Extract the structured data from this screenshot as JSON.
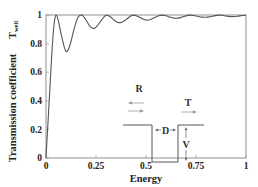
{
  "chart_data": {
    "type": "line",
    "title": "",
    "xlabel": "Energy",
    "ylabel": "Transmission  coefficient",
    "ylabel_extra": "T",
    "ylabel_extra_sub": "well",
    "xlim": [
      0,
      1
    ],
    "ylim": [
      0,
      1
    ],
    "grid": false,
    "legend": null,
    "x_ticks": [
      "0",
      "0.25",
      "0.5",
      "0.75",
      "1"
    ],
    "y_ticks": [
      "0",
      "0.2",
      "0.4",
      "0.6",
      "0.8",
      "1"
    ],
    "series": [
      {
        "name": "T_well",
        "color": "#555555",
        "x": [
          0.0,
          0.01,
          0.02,
          0.03,
          0.04,
          0.05,
          0.06,
          0.08,
          0.1,
          0.12,
          0.14,
          0.16,
          0.18,
          0.2,
          0.22,
          0.24,
          0.26,
          0.28,
          0.3,
          0.32,
          0.34,
          0.36,
          0.38,
          0.4,
          0.42,
          0.44,
          0.46,
          0.48,
          0.5,
          0.52,
          0.54,
          0.56,
          0.58,
          0.6,
          0.62,
          0.64,
          0.66,
          0.68,
          0.7,
          0.72,
          0.74,
          0.76,
          0.78,
          0.8,
          0.82,
          0.84,
          0.86,
          0.88,
          0.9,
          0.92,
          0.94,
          0.96,
          0.98,
          1.0
        ],
        "values": [
          0.0,
          0.25,
          0.5,
          0.75,
          0.93,
          1.0,
          0.97,
          0.84,
          0.745,
          0.79,
          0.9,
          0.985,
          1.0,
          0.965,
          0.92,
          0.905,
          0.93,
          0.97,
          0.998,
          0.99,
          0.965,
          0.948,
          0.95,
          0.968,
          0.99,
          0.999,
          0.99,
          0.975,
          0.965,
          0.967,
          0.98,
          0.993,
          0.999,
          0.995,
          0.985,
          0.978,
          0.978,
          0.985,
          0.994,
          0.999,
          0.997,
          0.99,
          0.985,
          0.984,
          0.988,
          0.994,
          0.999,
          0.998,
          0.993,
          0.989,
          0.989,
          0.992,
          0.996,
          0.999
        ]
      }
    ],
    "annotations": [
      {
        "text": "R",
        "role": "reflected-wave-label"
      },
      {
        "text": "T",
        "role": "transmitted-wave-label"
      },
      {
        "text": "D",
        "role": "well-width-label"
      },
      {
        "text": "V",
        "role": "well-depth-label"
      }
    ]
  }
}
